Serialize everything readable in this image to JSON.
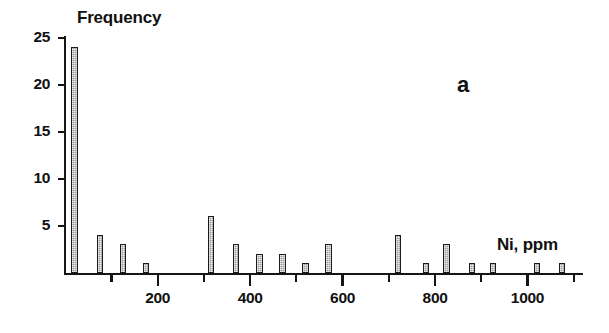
{
  "chart_data": {
    "type": "bar",
    "title": "",
    "subtitle": "",
    "panel_label": "a",
    "xlabel": "Ni, ppm",
    "ylabel": "Frequency",
    "xlim": [
      0,
      1120
    ],
    "ylim": [
      0,
      25
    ],
    "grid": false,
    "legend": null,
    "x_major_ticks": [
      200,
      400,
      600,
      800,
      1000
    ],
    "x_major_tick_labels": [
      "200",
      "400",
      "600",
      "800",
      "1000"
    ],
    "x_minor_ticks": [
      100,
      300,
      500,
      700,
      900,
      1100
    ],
    "y_ticks": [
      5,
      10,
      15,
      20,
      25
    ],
    "y_tick_labels": [
      "5",
      "10",
      "15",
      "20",
      "25"
    ],
    "bar_width_ppm": 14,
    "x": [
      20,
      75,
      125,
      175,
      315,
      370,
      420,
      470,
      520,
      570,
      720,
      780,
      825,
      880,
      925,
      1020,
      1075
    ],
    "values": [
      24,
      4,
      3,
      1,
      6,
      3,
      2,
      2,
      1,
      3,
      4,
      1,
      3,
      1,
      1,
      1,
      1
    ],
    "categories": [
      "20",
      "75",
      "125",
      "175",
      "315",
      "370",
      "420",
      "470",
      "520",
      "570",
      "720",
      "780",
      "825",
      "880",
      "925",
      "1020",
      "1075"
    ],
    "series": [
      {
        "name": "Frequency",
        "values": [
          24,
          4,
          3,
          1,
          6,
          3,
          2,
          2,
          1,
          3,
          4,
          1,
          3,
          1,
          1,
          1,
          1
        ]
      }
    ],
    "colors": {
      "bar_fill": "#9b9b9b",
      "bar_stroke": "#1a1a1a",
      "axis": "#151515",
      "text": "#111111",
      "background": "#ffffff"
    }
  }
}
